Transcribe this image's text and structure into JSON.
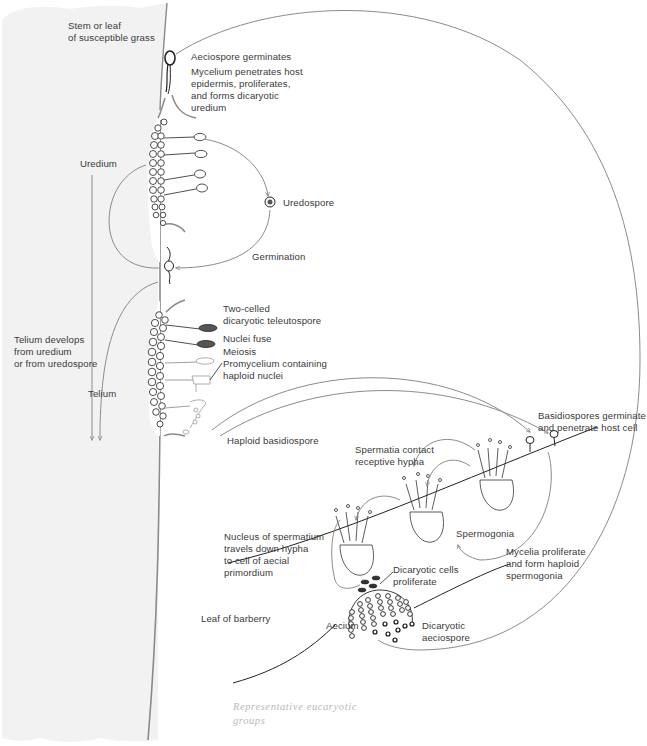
{
  "figure": {
    "colors": {
      "host_tissue": "#f2f2f2",
      "host_edge": "#8a8a8a",
      "line": "#8c8c8c",
      "ink": "#2a2a2a",
      "text": "#3a3a3a",
      "caption": "#b8b8b8"
    }
  },
  "labels": {
    "host_grass": "Stem or leaf\nof susceptible grass",
    "aeciospore_germinates": "Aeciospore germinates",
    "mycelium_penetrates": "Mycelium penetrates host\nepidermis, proliferates,\nand forms dicaryotic\nuredium",
    "uredium": "Uredium",
    "uredospore": "Uredospore",
    "germination": "Germination",
    "telium_develops": "Telium develops\nfrom uredium\nor from uredospore",
    "telium": "Telium",
    "two_celled": "Two-celled\ndicaryotic teleutospore",
    "nuclei_fuse": "Nuclei fuse",
    "meiosis": "Meiosis",
    "promycelium": "Promycelium containing\nhaploid nuclei",
    "haploid_basidiospore": "Haploid basidiospore",
    "basidiospores_germinate": "Basidiospores germinate\nand penetrate host cell",
    "spermatia_contact": "Spermatia contact\nreceptive hypha",
    "spermogonia": "Spermogonia",
    "mycelia_proliferate": "Mycelia proliferate\nand form haploid\nspermogonia",
    "nucleus_travels": "Nucleus of spermatium\ntravels down hypha\nto cell of aecial\nprimordium",
    "dicaryotic_cells": "Dicaryotic cells\nproliferate",
    "leaf_barberry": "Leaf of barberry",
    "aecium": "Aecium",
    "dicaryotic_aeciospore": "Dicaryotic\naeciospore"
  },
  "caption": {
    "text": "Representative eucaryotic\ngroups"
  },
  "stages": [
    {
      "name": "Aeciospore germination",
      "host": "grass"
    },
    {
      "name": "Uredium",
      "host": "grass"
    },
    {
      "name": "Uredospore",
      "host": "grass"
    },
    {
      "name": "Telium",
      "host": "grass"
    },
    {
      "name": "Basidiospore",
      "host": "none"
    },
    {
      "name": "Spermogonia",
      "host": "barberry"
    },
    {
      "name": "Aecium",
      "host": "barberry"
    }
  ]
}
